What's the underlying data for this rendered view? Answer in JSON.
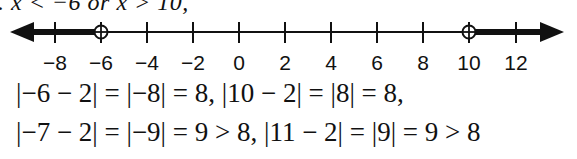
{
  "top_text": ". x < −6 or x > 10,",
  "number_line": {
    "ticks": [
      {
        "value": -8,
        "label": "−8",
        "x": 55
      },
      {
        "value": -6,
        "label": "−6",
        "x": 101
      },
      {
        "value": -4,
        "label": "−4",
        "x": 147
      },
      {
        "value": -2,
        "label": "−2",
        "x": 193
      },
      {
        "value": 0,
        "label": "0",
        "x": 239
      },
      {
        "value": 2,
        "label": "2",
        "x": 285
      },
      {
        "value": 4,
        "label": "4",
        "x": 331
      },
      {
        "value": 6,
        "label": "6",
        "x": 377
      },
      {
        "value": 8,
        "label": "8",
        "x": 423
      },
      {
        "value": 10,
        "label": "10",
        "x": 469
      },
      {
        "value": 12,
        "label": "12",
        "x": 516
      }
    ],
    "open_points": [
      -6,
      10
    ],
    "shaded": [
      "x < -6",
      "x > 10"
    ]
  },
  "equations": {
    "line1": "|−6 − 2| = |−8| = 8, |10 − 2| = |8| = 8,",
    "line2": "|−7 − 2| = |−9| = 9 > 8, |11 − 2| = |9| = 9 > 8"
  }
}
